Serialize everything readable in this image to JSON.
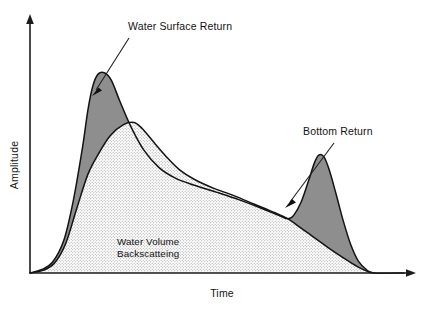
{
  "figure": {
    "title": "",
    "background_color": "#ffffff",
    "ink_color": "#131313"
  },
  "axes": {
    "y_label": "Amplitude",
    "x_label": "Time",
    "y_axis_name": "amplitude-axis",
    "x_axis_name": "time-axis",
    "has_tick_labels": false,
    "has_gridlines": false,
    "arrow_terminated": true
  },
  "annotations": [
    {
      "id": "water-surface-return",
      "label": "Water Surface Return",
      "text_x": 128,
      "text_y": 30,
      "leader_from_x": 129,
      "leader_from_y": 38,
      "leader_to_x": 94,
      "leader_to_y": 93,
      "points_at": "first-peak"
    },
    {
      "id": "bottom-return",
      "label": "Bottom Return",
      "text_x": 303,
      "text_y": 135,
      "leader_from_x": 334,
      "leader_from_y": 143,
      "leader_to_x": 287,
      "leader_to_y": 205,
      "points_at": "second-peak"
    }
  ],
  "region_labels": [
    {
      "id": "water-volume-backscattering",
      "line1": "Water Volume",
      "line2": "Backscatteing",
      "x": 117,
      "y": 245
    }
  ],
  "legend_fills": {
    "returns_fill": "#8e8e8e",
    "volume_fill": "#ffffff",
    "volume_pattern": "stipple-dots"
  },
  "chart_data": {
    "type": "area",
    "title": "",
    "xlabel": "Time",
    "ylabel": "Amplitude",
    "xlim": [
      0,
      1
    ],
    "ylim": [
      0,
      1
    ],
    "grid": false,
    "legend_position": "none",
    "axis_tick_labels": false,
    "series": [
      {
        "name": "Total Return",
        "fill": "#8e8e8e",
        "outline": "#131313",
        "points": [
          {
            "x": 0.0,
            "y": 0.0
          },
          {
            "x": 0.03,
            "y": 0.015
          },
          {
            "x": 0.06,
            "y": 0.05
          },
          {
            "x": 0.09,
            "y": 0.15
          },
          {
            "x": 0.115,
            "y": 0.33
          },
          {
            "x": 0.14,
            "y": 0.58
          },
          {
            "x": 0.155,
            "y": 0.76
          },
          {
            "x": 0.168,
            "y": 0.87
          },
          {
            "x": 0.182,
            "y": 0.925
          },
          {
            "x": 0.2,
            "y": 0.93
          },
          {
            "x": 0.218,
            "y": 0.895
          },
          {
            "x": 0.24,
            "y": 0.8
          },
          {
            "x": 0.27,
            "y": 0.68
          },
          {
            "x": 0.305,
            "y": 0.57
          },
          {
            "x": 0.345,
            "y": 0.49
          },
          {
            "x": 0.39,
            "y": 0.44
          },
          {
            "x": 0.44,
            "y": 0.408
          },
          {
            "x": 0.5,
            "y": 0.375
          },
          {
            "x": 0.56,
            "y": 0.34
          },
          {
            "x": 0.62,
            "y": 0.3
          },
          {
            "x": 0.665,
            "y": 0.268
          },
          {
            "x": 0.69,
            "y": 0.252
          },
          {
            "x": 0.705,
            "y": 0.268
          },
          {
            "x": 0.725,
            "y": 0.33
          },
          {
            "x": 0.745,
            "y": 0.43
          },
          {
            "x": 0.76,
            "y": 0.51
          },
          {
            "x": 0.772,
            "y": 0.548
          },
          {
            "x": 0.786,
            "y": 0.54
          },
          {
            "x": 0.8,
            "y": 0.48
          },
          {
            "x": 0.818,
            "y": 0.37
          },
          {
            "x": 0.838,
            "y": 0.24
          },
          {
            "x": 0.858,
            "y": 0.13
          },
          {
            "x": 0.878,
            "y": 0.055
          },
          {
            "x": 0.9,
            "y": 0.015
          },
          {
            "x": 0.92,
            "y": 0.0
          },
          {
            "x": 1.0,
            "y": 0.0
          }
        ]
      },
      {
        "name": "Water Volume Backscattering",
        "fill": "#ffffff",
        "pattern": "stipple-dots",
        "outline": "#131313",
        "points": [
          {
            "x": 0.0,
            "y": 0.0
          },
          {
            "x": 0.035,
            "y": 0.012
          },
          {
            "x": 0.065,
            "y": 0.045
          },
          {
            "x": 0.095,
            "y": 0.135
          },
          {
            "x": 0.125,
            "y": 0.3
          },
          {
            "x": 0.155,
            "y": 0.46
          },
          {
            "x": 0.185,
            "y": 0.56
          },
          {
            "x": 0.215,
            "y": 0.64
          },
          {
            "x": 0.25,
            "y": 0.69
          },
          {
            "x": 0.278,
            "y": 0.7
          },
          {
            "x": 0.3,
            "y": 0.672
          },
          {
            "x": 0.33,
            "y": 0.61
          },
          {
            "x": 0.365,
            "y": 0.54
          },
          {
            "x": 0.4,
            "y": 0.48
          },
          {
            "x": 0.44,
            "y": 0.435
          },
          {
            "x": 0.49,
            "y": 0.395
          },
          {
            "x": 0.545,
            "y": 0.36
          },
          {
            "x": 0.6,
            "y": 0.32
          },
          {
            "x": 0.655,
            "y": 0.28
          },
          {
            "x": 0.69,
            "y": 0.252
          },
          {
            "x": 0.72,
            "y": 0.215
          },
          {
            "x": 0.76,
            "y": 0.165
          },
          {
            "x": 0.8,
            "y": 0.115
          },
          {
            "x": 0.84,
            "y": 0.068
          },
          {
            "x": 0.875,
            "y": 0.03
          },
          {
            "x": 0.905,
            "y": 0.006
          },
          {
            "x": 0.92,
            "y": 0.0
          }
        ]
      }
    ],
    "annotations": [
      {
        "label": "Water Surface Return",
        "target_x": 0.2,
        "target_y": 0.93
      },
      {
        "label": "Bottom Return",
        "target_x": 0.772,
        "target_y": 0.548
      },
      {
        "label": "Water Volume Backscatteing",
        "target_x": 0.35,
        "target_y": 0.2
      }
    ]
  }
}
